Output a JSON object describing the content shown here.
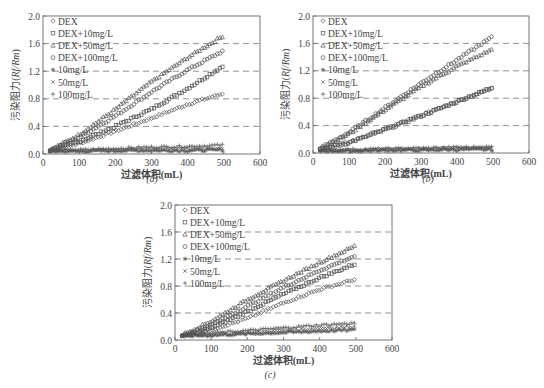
{
  "figure": {
    "captions": [
      "(a)",
      "(b)",
      "(c)"
    ]
  },
  "legend_labels": [
    "DEX",
    "DEX+10mg/L",
    "DEX+50mg/L",
    "DEX+100mg/L",
    "10mg/L",
    "50mg/L",
    "100mg/L"
  ],
  "legend_markers": [
    "diamond",
    "square",
    "triangle",
    "circle",
    "asterisk",
    "x-cross",
    "plus"
  ],
  "chart_data": [
    {
      "type": "scatter",
      "panel": "(a)",
      "title": "",
      "xlabel": "过滤体积(mL)",
      "ylabel": "污染阻力(Rf/Rm)",
      "xlim": [
        0,
        600
      ],
      "ylim": [
        0,
        2.0
      ],
      "xticks": [
        0,
        100,
        200,
        300,
        400,
        500,
        600
      ],
      "yticks": [
        0.0,
        0.4,
        0.8,
        1.2,
        1.6,
        2.0
      ],
      "grid": "dashed horizontal at 0.4, 0.8, 1.2, 1.6",
      "legend_position": "upper left",
      "x": [
        20,
        100,
        200,
        300,
        400,
        500
      ],
      "series": [
        {
          "name": "DEX",
          "marker": "diamond",
          "values": [
            0.05,
            0.15,
            0.33,
            0.52,
            0.72,
            0.88
          ]
        },
        {
          "name": "DEX+10mg/L",
          "marker": "square",
          "values": [
            0.05,
            0.18,
            0.4,
            0.65,
            0.95,
            1.28
          ]
        },
        {
          "name": "DEX+50mg/L",
          "marker": "triangle",
          "values": [
            0.06,
            0.28,
            0.65,
            1.05,
            1.4,
            1.72
          ]
        },
        {
          "name": "DEX+100mg/L",
          "marker": "circle",
          "values": [
            0.06,
            0.24,
            0.55,
            0.9,
            1.22,
            1.5
          ]
        },
        {
          "name": "10mg/L",
          "marker": "asterisk",
          "values": [
            0.04,
            0.04,
            0.05,
            0.05,
            0.05,
            0.06
          ]
        },
        {
          "name": "50mg/L",
          "marker": "x-cross",
          "values": [
            0.05,
            0.05,
            0.06,
            0.07,
            0.08,
            0.08
          ]
        },
        {
          "name": "100mg/L",
          "marker": "plus",
          "values": [
            0.05,
            0.06,
            0.08,
            0.1,
            0.11,
            0.13
          ]
        }
      ]
    },
    {
      "type": "scatter",
      "panel": "(b)",
      "title": "",
      "xlabel": "过滤体积(mL)",
      "ylabel": "污染阻力(Rf/Rm)",
      "xlim": [
        0,
        600
      ],
      "ylim": [
        0,
        2.0
      ],
      "xticks": [
        0,
        100,
        200,
        300,
        400,
        500,
        600
      ],
      "yticks": [
        0.0,
        0.4,
        0.8,
        1.2,
        1.6,
        2.0
      ],
      "grid": "dashed horizontal at 0.4, 0.8, 1.2, 1.6",
      "legend_position": "upper left",
      "x": [
        20,
        100,
        200,
        300,
        400,
        500
      ],
      "series": [
        {
          "name": "DEX",
          "marker": "diamond",
          "values": [
            0.06,
            0.16,
            0.35,
            0.55,
            0.76,
            0.95
          ]
        },
        {
          "name": "DEX+10mg/L",
          "marker": "square",
          "values": [
            0.05,
            0.15,
            0.34,
            0.54,
            0.75,
            0.96
          ]
        },
        {
          "name": "DEX+50mg/L",
          "marker": "triangle",
          "values": [
            0.07,
            0.28,
            0.63,
            0.97,
            1.27,
            1.52
          ]
        },
        {
          "name": "DEX+100mg/L",
          "marker": "circle",
          "values": [
            0.07,
            0.3,
            0.66,
            1.02,
            1.36,
            1.7
          ]
        },
        {
          "name": "10mg/L",
          "marker": "asterisk",
          "values": [
            0.03,
            0.03,
            0.04,
            0.04,
            0.05,
            0.05
          ]
        },
        {
          "name": "50mg/L",
          "marker": "x-cross",
          "values": [
            0.04,
            0.04,
            0.05,
            0.06,
            0.07,
            0.08
          ]
        },
        {
          "name": "100mg/L",
          "marker": "plus",
          "values": [
            0.04,
            0.05,
            0.06,
            0.07,
            0.08,
            0.09
          ]
        }
      ]
    },
    {
      "type": "scatter",
      "panel": "(c)",
      "title": "",
      "xlabel": "过滤体积(mL)",
      "ylabel": "污染阻力(Rf/Rm)",
      "xlim": [
        0,
        600
      ],
      "ylim": [
        0,
        2.0
      ],
      "xticks": [
        0,
        100,
        200,
        300,
        400,
        500,
        600
      ],
      "yticks": [
        0.0,
        0.4,
        0.8,
        1.2,
        1.6,
        2.0
      ],
      "grid": "dashed horizontal at 0.4, 0.8, 1.2, 1.6",
      "legend_position": "upper left",
      "x": [
        20,
        100,
        200,
        300,
        400,
        500
      ],
      "series": [
        {
          "name": "DEX",
          "marker": "diamond",
          "values": [
            0.06,
            0.15,
            0.32,
            0.55,
            0.75,
            0.9
          ]
        },
        {
          "name": "DEX+10mg/L",
          "marker": "square",
          "values": [
            0.05,
            0.18,
            0.42,
            0.68,
            0.92,
            1.13
          ]
        },
        {
          "name": "DEX+50mg/L",
          "marker": "triangle",
          "values": [
            0.08,
            0.28,
            0.6,
            0.88,
            1.15,
            1.4
          ]
        },
        {
          "name": "DEX+100mg/L",
          "marker": "circle",
          "values": [
            0.07,
            0.22,
            0.5,
            0.78,
            1.03,
            1.25
          ]
        },
        {
          "name": "10mg/L",
          "marker": "asterisk",
          "values": [
            0.06,
            0.07,
            0.09,
            0.11,
            0.13,
            0.15
          ]
        },
        {
          "name": "50mg/L",
          "marker": "x-cross",
          "values": [
            0.07,
            0.08,
            0.11,
            0.14,
            0.17,
            0.2
          ]
        },
        {
          "name": "100mg/L",
          "marker": "plus",
          "values": [
            0.08,
            0.1,
            0.14,
            0.18,
            0.22,
            0.25
          ]
        }
      ]
    }
  ]
}
